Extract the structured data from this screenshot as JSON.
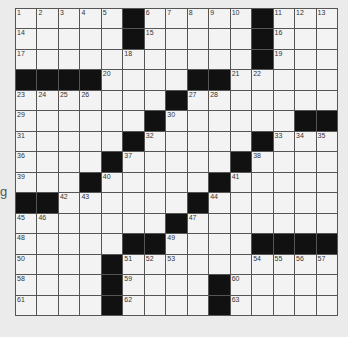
{
  "puzzle": {
    "rows": 15,
    "cols": 15,
    "side_glyph": "g",
    "colors": {
      "background": "#ebebeb",
      "cell": "#f3f3f3",
      "block": "#111111",
      "gridline": "#555555"
    },
    "layout": [
      "1 2 3 4 5 # 6 7 8 9 10 # 11 12 13",
      "14 . . . . # 15 . . . . # 16 . .",
      "17 . . . . 18 . . . . . # 19 . .",
      "# # # # 20 . . . # # 21 22 . . .",
      "23 24 25 26 . . . # 27 28 . . . . .",
      "29 . . . . . # 30 . . . . . # #",
      "31 . . . . # 32 . . . . # 33 34 35",
      "36 . . . # 37 . . . . # 38 . . .",
      "39 . . # 40 . . . . # 41 . . . .",
      "# # 42 43 . . . . # 44 . . . . .",
      "45 46 . . . . . # 47 . . . . . .",
      "48 . . . . # # 49 . . . # # # #",
      "50 . . . # 51 52 53 . . . 54 55 56 57",
      "58 . . . # 59 . . . # 60 . . . .",
      "61 . . . # 62 . . . # 63 . . . ."
    ]
  }
}
